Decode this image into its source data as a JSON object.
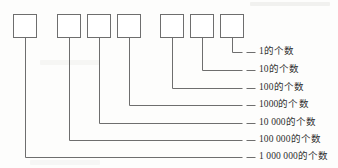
{
  "diagram": {
    "type": "place-value-boxes",
    "box_count": 7,
    "stroke_color": "#6e6e6e",
    "box_fill": "#ffffff",
    "text_color": "#2e2e2e",
    "background": "#fdfdfc",
    "boxes": [
      {
        "index": 1,
        "name": "box-millions",
        "x": 13,
        "y": 14,
        "w": 23,
        "h": 23
      },
      {
        "index": 2,
        "name": "box-hundred-thousands",
        "x": 57,
        "y": 14,
        "w": 23,
        "h": 23
      },
      {
        "index": 3,
        "name": "box-ten-thousands",
        "x": 87,
        "y": 14,
        "w": 23,
        "h": 23
      },
      {
        "index": 4,
        "name": "box-thousands",
        "x": 117,
        "y": 14,
        "w": 23,
        "h": 23
      },
      {
        "index": 5,
        "name": "box-hundreds",
        "x": 160,
        "y": 14,
        "w": 23,
        "h": 23
      },
      {
        "index": 6,
        "name": "box-tens",
        "x": 190,
        "y": 14,
        "w": 23,
        "h": 23
      },
      {
        "index": 7,
        "name": "box-ones",
        "x": 220,
        "y": 14,
        "w": 23,
        "h": 23
      }
    ],
    "rows": [
      {
        "index": 1,
        "box_index": 7,
        "label": "1的个数",
        "y": 52,
        "name": "label-ones"
      },
      {
        "index": 2,
        "box_index": 6,
        "label": "10的个数",
        "y": 70,
        "name": "label-tens"
      },
      {
        "index": 3,
        "box_index": 5,
        "label": "100的个数",
        "y": 88,
        "name": "label-hundreds"
      },
      {
        "index": 4,
        "box_index": 4,
        "label": "1000的个数",
        "y": 105,
        "name": "label-thousands"
      },
      {
        "index": 5,
        "box_index": 3,
        "label": "10 000的个数",
        "y": 123,
        "name": "label-ten-thousands"
      },
      {
        "index": 6,
        "box_index": 2,
        "label": "100 000的个数",
        "y": 140,
        "name": "label-hundred-thousands"
      },
      {
        "index": 7,
        "box_index": 1,
        "label": "1 000 000的个数",
        "y": 157,
        "name": "label-millions"
      }
    ],
    "leader_end_x": 242,
    "dash_start_x": 246,
    "dash_end_x": 255,
    "label_text_x": 259
  }
}
